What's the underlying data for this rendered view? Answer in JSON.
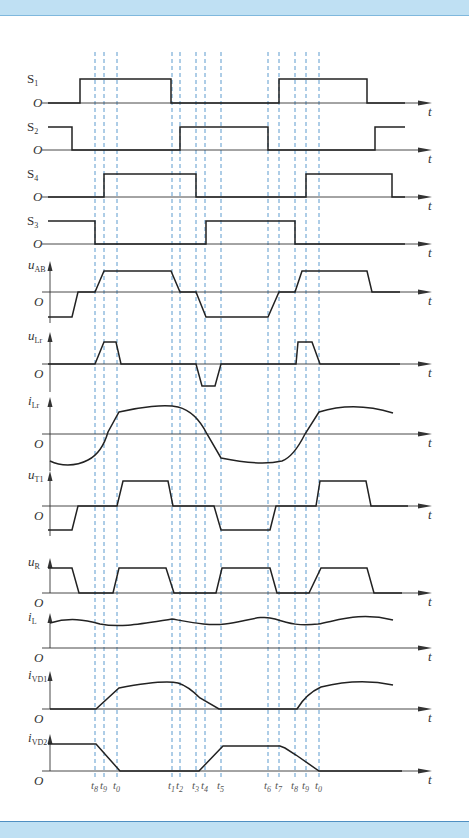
{
  "diagram": {
    "type": "timing-waveform",
    "time_markers": {
      "positions_x": [
        95,
        104,
        117,
        172,
        180,
        196,
        205,
        221,
        268,
        279,
        295,
        306,
        319
      ],
      "labels": [
        "t8",
        "t9",
        "t0",
        "t1",
        "t2",
        "t3",
        "t4",
        "t5",
        "t6",
        "t7",
        "t8",
        "t9",
        "t0"
      ],
      "label_bases": [
        "t",
        "t",
        "t",
        "t",
        "t",
        "t",
        "t",
        "t",
        "t",
        "t",
        "t",
        "t",
        "t"
      ],
      "label_subs": [
        "8",
        "9",
        "0",
        "1",
        "2",
        "3",
        "4",
        "5",
        "6",
        "7",
        "8",
        "9",
        "0"
      ],
      "line_color": "#4a90c8"
    },
    "axis_end_label": "t",
    "origin_label": "O",
    "colors": {
      "waveform": "#222222",
      "axis": "#333333",
      "band": "#bfe0f3",
      "band_border": "#4f8fc2"
    },
    "traces": [
      {
        "id": "S1",
        "label_base": "S",
        "label_sub": "1",
        "axis_y": 103,
        "high_y": 79,
        "points": [
          [
            48,
            103
          ],
          [
            80,
            103
          ],
          [
            80,
            79
          ],
          [
            171,
            79
          ],
          [
            171,
            103
          ],
          [
            267,
            103
          ],
          [
            279,
            103
          ],
          [
            279,
            79
          ],
          [
            367,
            79
          ],
          [
            367,
            103
          ],
          [
            405,
            103
          ]
        ]
      },
      {
        "id": "S2",
        "label_base": "S",
        "label_sub": "2",
        "axis_y": 150,
        "high_y": 127,
        "points": [
          [
            48,
            127
          ],
          [
            72,
            127
          ],
          [
            72,
            150
          ],
          [
            180,
            150
          ],
          [
            180,
            127
          ],
          [
            268,
            127
          ],
          [
            268,
            150
          ],
          [
            375,
            150
          ],
          [
            375,
            127
          ],
          [
            405,
            127
          ]
        ]
      },
      {
        "id": "S4",
        "label_base": "S",
        "label_sub": "4",
        "axis_y": 197,
        "high_y": 174,
        "points": [
          [
            48,
            197
          ],
          [
            104,
            197
          ],
          [
            104,
            174
          ],
          [
            196,
            174
          ],
          [
            196,
            197
          ],
          [
            306,
            197
          ],
          [
            306,
            174
          ],
          [
            392,
            174
          ],
          [
            392,
            197
          ],
          [
            405,
            197
          ]
        ]
      },
      {
        "id": "S3",
        "label_base": "S",
        "label_sub": "3",
        "axis_y": 244,
        "high_y": 221,
        "points": [
          [
            48,
            221
          ],
          [
            95,
            221
          ],
          [
            95,
            244
          ],
          [
            206,
            244
          ],
          [
            206,
            221
          ],
          [
            295,
            221
          ],
          [
            295,
            244
          ],
          [
            405,
            244
          ]
        ]
      },
      {
        "id": "uAB",
        "label_base": "u",
        "label_sub": "AB",
        "axis_y": 292,
        "high_y": 271,
        "low_y": 317,
        "points": [
          [
            48,
            317
          ],
          [
            72,
            317
          ],
          [
            78,
            292
          ],
          [
            95,
            292
          ],
          [
            104,
            271
          ],
          [
            171,
            271
          ],
          [
            180,
            292
          ],
          [
            196,
            292
          ],
          [
            206,
            317
          ],
          [
            268,
            317
          ],
          [
            279,
            292
          ],
          [
            295,
            292
          ],
          [
            302,
            271
          ],
          [
            367,
            271
          ],
          [
            372,
            292
          ],
          [
            400,
            292
          ]
        ]
      },
      {
        "id": "uLr",
        "label_base": "u",
        "label_sub": "Lr",
        "axis_y": 364,
        "high_y": 342,
        "low_y": 386,
        "points": [
          [
            48,
            364
          ],
          [
            95,
            364
          ],
          [
            104,
            342
          ],
          [
            116,
            342
          ],
          [
            121,
            364
          ],
          [
            196,
            364
          ],
          [
            202,
            386
          ],
          [
            215,
            386
          ],
          [
            221,
            364
          ],
          [
            296,
            364
          ],
          [
            298,
            342
          ],
          [
            312,
            342
          ],
          [
            320,
            364
          ],
          [
            400,
            364
          ]
        ]
      },
      {
        "id": "iLr",
        "label_base": "i",
        "label_sub": "Lr",
        "axis_y": 434,
        "high_y": 407,
        "low_y": 465,
        "curve": true,
        "path": "M50,461 C60,466 75,467 88,460 C98,455 104,446 108,432 L119,412 C140,407 165,404 178,407 C190,410 200,420 207,434 L221,458 C240,462 265,465 282,461 C290,458 298,448 305,434 L319,412 C345,404 370,406 393,413"
      },
      {
        "id": "uT1",
        "label_base": "u",
        "label_sub": "T1",
        "axis_y": 506,
        "high_y": 481,
        "low_y": 530,
        "points": [
          [
            48,
            530
          ],
          [
            72,
            530
          ],
          [
            78,
            506
          ],
          [
            117,
            506
          ],
          [
            123,
            481
          ],
          [
            168,
            481
          ],
          [
            173,
            506
          ],
          [
            214,
            506
          ],
          [
            221,
            530
          ],
          [
            270,
            530
          ],
          [
            276,
            506
          ],
          [
            316,
            506
          ],
          [
            320,
            481
          ],
          [
            366,
            481
          ],
          [
            371,
            506
          ],
          [
            408,
            506
          ]
        ]
      },
      {
        "id": "uR",
        "label_base": "u",
        "label_sub": "R",
        "axis_y": 593,
        "high_y": 568,
        "points": [
          [
            48,
            568
          ],
          [
            72,
            568
          ],
          [
            79,
            593
          ],
          [
            113,
            593
          ],
          [
            119,
            568
          ],
          [
            166,
            568
          ],
          [
            174,
            593
          ],
          [
            216,
            593
          ],
          [
            222,
            568
          ],
          [
            270,
            568
          ],
          [
            277,
            593
          ],
          [
            309,
            593
          ],
          [
            321,
            568
          ],
          [
            367,
            568
          ],
          [
            374,
            593
          ],
          [
            402,
            593
          ]
        ]
      },
      {
        "id": "iL",
        "label_base": "i",
        "label_sub": "L",
        "axis_y": 648,
        "curve": true,
        "path": "M50,623 C70,617 85,620 100,624 C120,628 140,624 172,619 C195,623 210,626 225,624 C245,622 260,614 275,619 C290,624 300,626 318,624 C340,620 360,612 393,620"
      },
      {
        "id": "iVD1",
        "label_base": "i",
        "label_sub": "VD1",
        "axis_y": 709,
        "high_y": 681,
        "curve": true,
        "path": "M50,709 L96,709 L119,688 C140,684 165,680 178,683 C188,686 195,693 200,698 L219,709 L297,709 C303,699 310,692 321,687 C345,681 370,680 393,685"
      },
      {
        "id": "iVD2",
        "label_base": "i",
        "label_sub": "VD2",
        "axis_y": 771,
        "high_y": 744,
        "points": [
          [
            48,
            744
          ],
          [
            96,
            744
          ],
          [
            120,
            771
          ],
          [
            199,
            771
          ],
          [
            223,
            746
          ],
          [
            280,
            746
          ],
          [
            285,
            748
          ],
          [
            296,
            755
          ],
          [
            319,
            771
          ],
          [
            402,
            771
          ]
        ]
      }
    ]
  }
}
